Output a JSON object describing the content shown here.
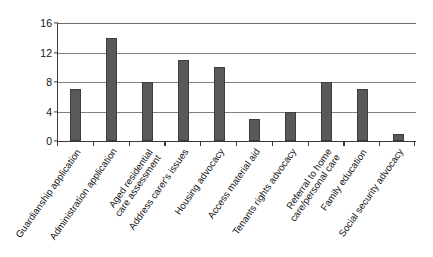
{
  "chart_data": {
    "type": "bar",
    "title": "",
    "subtitle": "",
    "xlabel": "",
    "ylabel": "Number of patients",
    "ylim": [
      0,
      16
    ],
    "yticks": [
      0,
      4,
      8,
      12,
      16
    ],
    "ytick_labels": [
      "0",
      "4",
      "8",
      "12",
      "16"
    ],
    "grid": true,
    "grid_axis": "y",
    "legend": false,
    "legend_position": "none",
    "bar_color": "#595959",
    "bar_edge_color": "#3d3d3d",
    "axis_color": "#3a3a3a",
    "gridline_color": "#808080",
    "background_color": "#ffffff",
    "xtick_label_rotation": -55,
    "categories": [
      "Guardianship application",
      "Administration application",
      "Aged residential\ncare assessment",
      "Address carer's issues",
      "Housing advocacy",
      "Access material aid",
      "Tenants rights advocacy",
      "Referral to home\ncare/personal care",
      "Family education",
      "Social security advocacy"
    ],
    "values": [
      7,
      14,
      8,
      11,
      10,
      3,
      4,
      8,
      7,
      1
    ]
  }
}
